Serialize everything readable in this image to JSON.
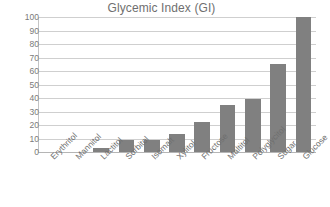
{
  "chart_data": {
    "type": "bar",
    "title": "Glycemic Index (GI)",
    "xlabel": "",
    "ylabel": "",
    "ylim": [
      0,
      100
    ],
    "ytick_step": 10,
    "grid": true,
    "legend": false,
    "bar_color": "#808080",
    "grid_color": "#cfcfcf",
    "text_color": "#6f6f6f",
    "categories": [
      "Erythritol",
      "Mannitol",
      "Lactitol",
      "Sorbitol",
      "Isomalt",
      "Xylitol",
      "Fructose",
      "Maltitol",
      "Polyglycitol",
      "Sugar",
      "Glucose"
    ],
    "values": [
      0,
      0,
      3,
      9,
      9,
      13,
      22,
      35,
      39,
      65,
      100
    ],
    "ytick_labels": [
      "100",
      "90",
      "80",
      "70",
      "60",
      "50",
      "40",
      "30",
      "20",
      "10",
      "0"
    ],
    "ytick_values": [
      100,
      90,
      80,
      70,
      60,
      50,
      40,
      30,
      20,
      10,
      0
    ]
  }
}
